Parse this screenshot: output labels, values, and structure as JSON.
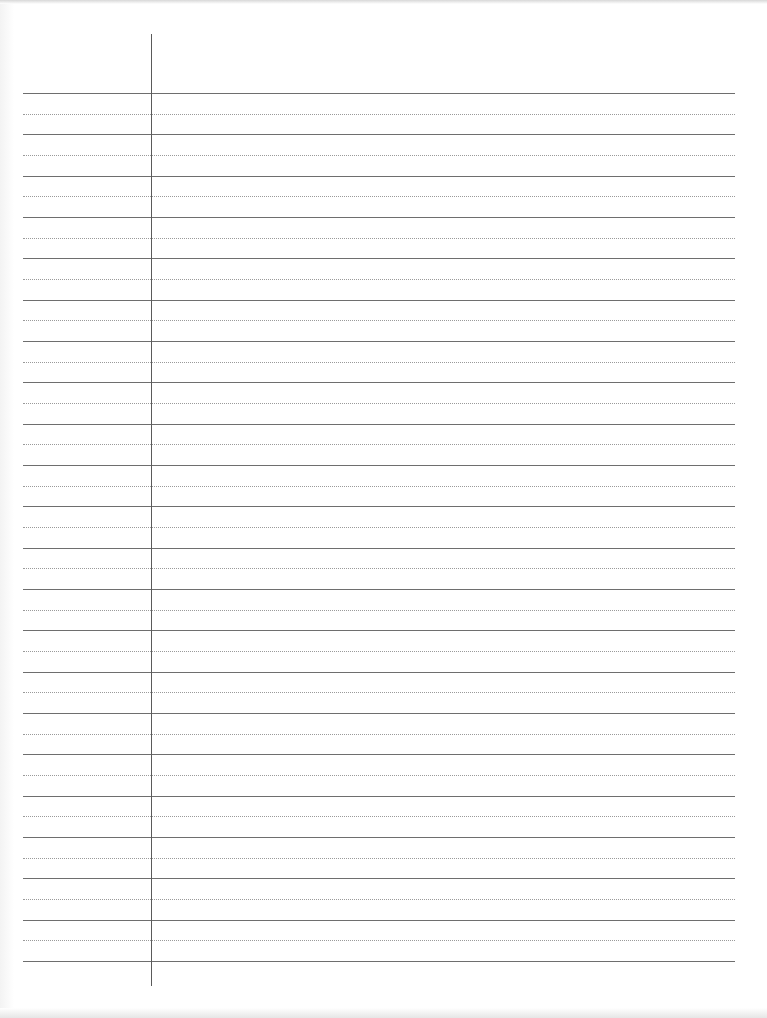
{
  "document": {
    "type": "ruled-paper",
    "background_color": "#ffffff",
    "rule_color": "#6e6e6e",
    "dotted_rule_color": "#9a9a9a",
    "margin_line_color": "#5a5a5a",
    "solid_rule_count": 22,
    "dotted_rule_count": 21,
    "first_rule_y": 93,
    "rule_spacing": 41.33,
    "margin_line_x": 151
  }
}
